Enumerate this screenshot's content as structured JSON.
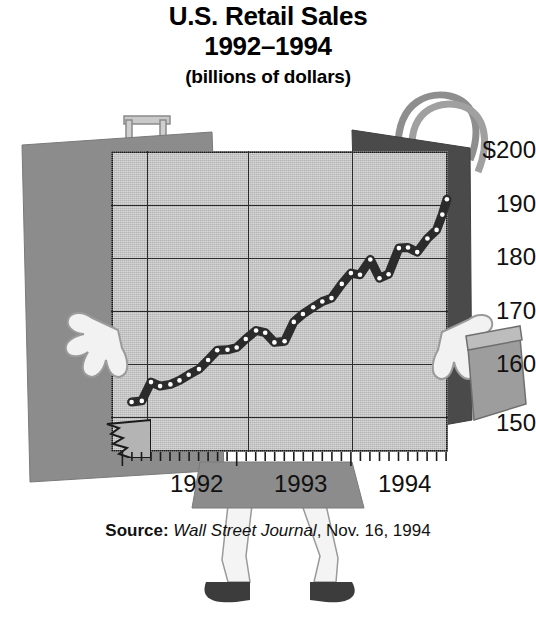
{
  "title": {
    "line1": "U.S. Retail Sales",
    "line2": "1992–1994",
    "line3": "(billions of dollars)"
  },
  "source": {
    "label": "Source:",
    "publication": "Wall Street Journal",
    "date": ", Nov. 16, 1994"
  },
  "colors": {
    "plot_background": "#b4b4b4",
    "line": "#2b2b2b",
    "marker": "#ffffff",
    "axis": "#1a1a1a",
    "bag_left": "#8c8c8c",
    "bag_right": "#4a4a4a",
    "skirt": "#8c8c8c",
    "shoe": "#3c3c3c",
    "glove": "#f2f2f2"
  },
  "art": {
    "left_bag": "shopping-bag-gray",
    "right_bag": "shopping-bag-dark",
    "small_box": "gift-box",
    "left_hand": "glove-hand-left",
    "right_hand": "glove-hand-right",
    "legs": "cartoon-legs",
    "shoes": "cartoon-shoes",
    "axis_break": "axis-break-zigzag"
  },
  "chart_data": {
    "type": "line",
    "title": "U.S. Retail Sales 1992–1994 (billions of dollars)",
    "xlabel": "",
    "ylabel": "billions of dollars",
    "ylim": [
      147,
      200
    ],
    "yticks": [
      150,
      160,
      170,
      180,
      190,
      200
    ],
    "ytick_labels": [
      "150",
      "160",
      "170",
      "180",
      "190",
      "$200"
    ],
    "xticks": [
      1992,
      1993,
      1994
    ],
    "xtick_labels": [
      "1992",
      "1993",
      "1994"
    ],
    "xlim": [
      1991.9,
      1994.85
    ],
    "grid": true,
    "legend": false,
    "y_axis_break": true,
    "minor_xticks": "monthly",
    "marker": "circle-white",
    "x": [
      1992.08,
      1992.17,
      1992.25,
      1992.33,
      1992.42,
      1992.5,
      1992.58,
      1992.67,
      1992.75,
      1992.83,
      1992.92,
      1993.0,
      1993.08,
      1993.17,
      1993.25,
      1993.33,
      1993.42,
      1993.5,
      1993.58,
      1993.67,
      1993.75,
      1993.83,
      1993.92,
      1994.0,
      1994.08,
      1994.17,
      1994.25,
      1994.33,
      1994.42,
      1994.5,
      1994.58,
      1994.67,
      1994.75
    ],
    "values": [
      155.8,
      156.0,
      159.3,
      158.6,
      158.9,
      159.6,
      160.6,
      161.6,
      163.2,
      164.9,
      165.0,
      165.4,
      166.9,
      168.4,
      168.0,
      166.3,
      166.5,
      169.9,
      171.3,
      172.5,
      173.5,
      174.1,
      176.6,
      178.5,
      178.2,
      180.9,
      177.6,
      178.3,
      182.9,
      183.0,
      182.2,
      184.6,
      186.1
    ],
    "extra_points": {
      "note": "final rising segment",
      "x": [
        1994.8,
        1994.84
      ],
      "values": [
        188.8,
        191.5
      ]
    }
  }
}
